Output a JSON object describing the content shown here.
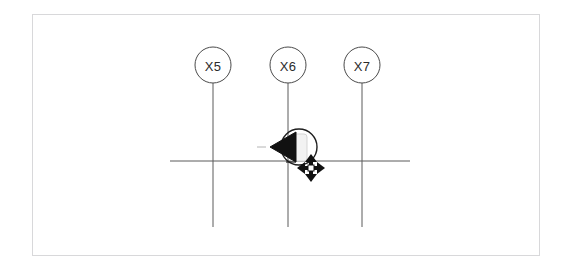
{
  "canvas": {
    "width": 566,
    "height": 271,
    "background": "#ffffff"
  },
  "sheet_frame": {
    "name": "drawing-sheet-border",
    "x": 32,
    "y": 14,
    "width": 508,
    "height": 242,
    "stroke": "#d8d8da"
  },
  "drawing": {
    "line_color": "#5a5a5a",
    "bubble_stroke": "#4a4a4a",
    "bubble_fill": "#ffffff",
    "bubble_radius": 18,
    "grid_lines": [
      {
        "id": "gridline-x5",
        "label": "X5",
        "x": 213,
        "bubble_cy": 65,
        "line_top": 83,
        "line_bottom": 227
      },
      {
        "id": "gridline-x6",
        "label": "X6",
        "x": 288,
        "bubble_cy": 65,
        "line_top": 83,
        "line_bottom": 227
      },
      {
        "id": "gridline-x7",
        "label": "X7",
        "x": 362,
        "bubble_cy": 65,
        "line_top": 83,
        "line_bottom": 227
      }
    ],
    "horizontal_line": {
      "id": "horizontal-wall-line",
      "x1": 170,
      "x2": 410,
      "y": 161
    },
    "callout_marker": {
      "id": "section-callout-marker",
      "cx": 299,
      "cy": 147,
      "radius": 18,
      "arrow_direction": "left",
      "arrow_tip_x": 270,
      "arrow_fill": "#1a1a1a",
      "inner_tag_fill": "#f0f0f0",
      "leader_dash": {
        "x1": 257,
        "x2": 266,
        "y": 147
      }
    },
    "move_cursor": {
      "id": "move-cursor",
      "cx": 311,
      "cy": 168,
      "arm": 13,
      "color": "#111111"
    }
  },
  "labels": {
    "x5": "X5",
    "x6": "X6",
    "x7": "X7"
  }
}
